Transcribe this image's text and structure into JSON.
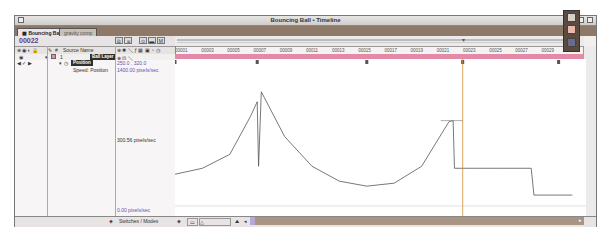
{
  "window": {
    "title": "Bouncing Ball • Timeline"
  },
  "tabs": [
    {
      "label": "Bouncing Ball",
      "active": true
    },
    {
      "label": "gravity comp",
      "active": false
    }
  ],
  "timecode": "00022",
  "toolbar_buttons": [
    "comp-icon",
    "flowchart-icon",
    "graph-icon",
    "marker-icon",
    "M"
  ],
  "columns": {
    "switches_icons": "⊕ ◉ ◐ 🔒",
    "label_icon": "✎",
    "number": "#",
    "source_name": "Source Name",
    "switch_icons": "⊕ ✱ ＼ ƒ ▦ ▣ ◔ ◷"
  },
  "ruler": {
    "ticks": [
      "00001",
      "00003",
      "00005",
      "00007",
      "00009",
      "00011",
      "00013",
      "00015",
      "00017",
      "00019",
      "00021",
      "00023",
      "00025",
      "00027",
      "00029",
      "0003"
    ]
  },
  "layer": {
    "number": "1",
    "name": "Ball Layer",
    "switches": "⊕ ⊡ ＼"
  },
  "property": {
    "name": "Position",
    "value": "250.0 , 320.0"
  },
  "speed": {
    "label": "Speed: Position",
    "max": "1400.00 pixels/sec",
    "mid": "300.56 pixels/sec",
    "min": "0.00 pixels/sec"
  },
  "bottom": {
    "switches_modes": "Switches / Modes"
  },
  "colors": {
    "timecode": "#5a3b8c",
    "layer_bar": "#e28aa8",
    "current_time": "#d28a3a",
    "tab_bar": "#8e7868",
    "value_purple": "#6a4fb0"
  },
  "chart_data": {
    "type": "line",
    "title": "Speed: Position",
    "ylabel": "pixels/sec",
    "ylim": [
      0,
      1400
    ],
    "x": [
      1,
      3,
      5,
      6.5,
      7,
      7.1,
      7.3,
      9,
      11,
      13,
      15,
      17,
      19,
      21,
      21.3,
      21.4,
      23,
      25,
      27,
      27.2,
      30
    ],
    "values": [
      320,
      380,
      520,
      900,
      1050,
      400,
      1150,
      700,
      400,
      250,
      200,
      230,
      400,
      850,
      860,
      380,
      380,
      380,
      380,
      110,
      110
    ],
    "keyframes_x": [
      1,
      7,
      15,
      22,
      29
    ],
    "current_time": 22
  }
}
